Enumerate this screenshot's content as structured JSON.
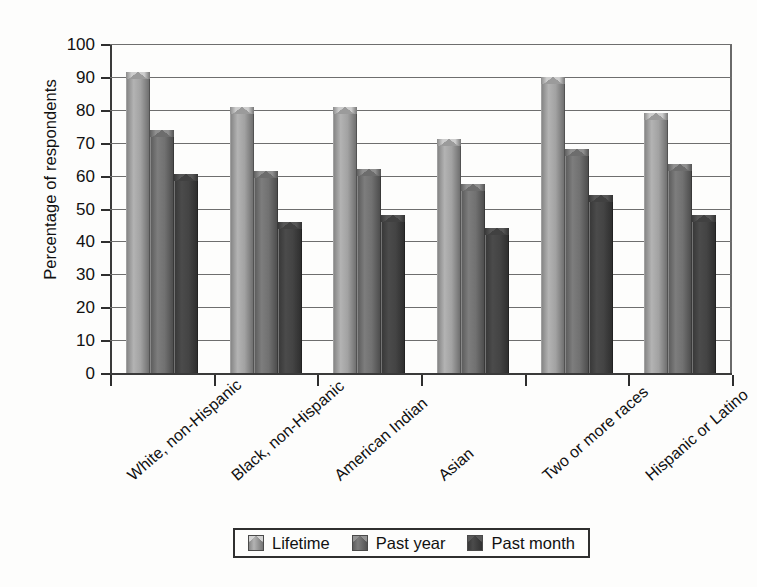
{
  "chart_data": {
    "type": "bar",
    "title": "",
    "subtitle": "",
    "xlabel": "",
    "ylabel": "Percentage of respondents",
    "ylim": [
      0,
      100
    ],
    "yticks": [
      0,
      10,
      20,
      30,
      40,
      50,
      60,
      70,
      80,
      90,
      100
    ],
    "ytick_labels": [
      "0",
      "10",
      "20",
      "30",
      "40",
      "50",
      "60",
      "70",
      "80",
      "90",
      "100"
    ],
    "grid": "horizontal",
    "legend_position": "bottom-center",
    "bar_style": "3d-cone-top",
    "orientation": "vertical",
    "group_mode": "clustered",
    "categories": [
      "White, non-Hispanic",
      "Black, non-Hispanic",
      "American Indian",
      "Asian",
      "Two or more races",
      "Hispanic or Latino"
    ],
    "series": [
      {
        "name": "Lifetime",
        "color": "#a9a9a9",
        "values": [
          91.5,
          81,
          81,
          71,
          90,
          79
        ]
      },
      {
        "name": "Past year",
        "color": "#767676",
        "values": [
          74,
          61.5,
          62,
          57.5,
          68,
          63.5
        ]
      },
      {
        "name": "Past month",
        "color": "#474747",
        "values": [
          60.5,
          46,
          48,
          44,
          54,
          48
        ]
      }
    ]
  },
  "legend": {
    "items": [
      {
        "label": "Lifetime",
        "color": "#a9a9a9"
      },
      {
        "label": "Past year",
        "color": "#767676"
      },
      {
        "label": "Past month",
        "color": "#474747"
      }
    ]
  },
  "axes": {
    "y_title": "Percentage of respondents"
  },
  "colors": {
    "background": "#fdfdfc",
    "axis": "#2e2e2e",
    "gridline": "#6e6e6e",
    "text": "#111111",
    "series_lifetime": "#a9a9a9",
    "series_past_year": "#767676",
    "series_past_month": "#474747"
  }
}
